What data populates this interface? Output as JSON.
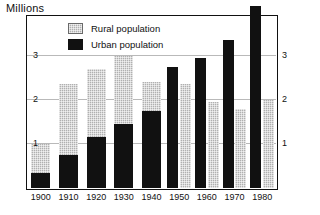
{
  "chart": {
    "title": "Millions",
    "axis_title_position": "top-left"
  },
  "legend": {
    "position": "top-left-inside",
    "items": [
      {
        "key": "rural",
        "label": "Rural population",
        "color": "#b0b0b0",
        "swatch": "rural-swatch"
      },
      {
        "key": "urban",
        "label": "Urban population",
        "color": "#111111",
        "swatch": "urban-swatch"
      }
    ]
  },
  "axes": {
    "y_left_ticks": [
      "3",
      "2",
      "1"
    ],
    "y_right_ticks": [
      "3",
      "2",
      "1"
    ],
    "x_ticks": [
      "1900",
      "1910",
      "1920",
      "1930",
      "1940",
      "1950",
      "1960",
      "1970",
      "1980"
    ]
  },
  "chart_data": {
    "type": "bar",
    "title": "Millions",
    "subtitle": "",
    "xlabel": "",
    "ylabel": "Millions",
    "ylim": [
      0,
      3.9
    ],
    "yticks": [
      1,
      2,
      3
    ],
    "grid": true,
    "legend_position": "top-left",
    "categories": [
      "1900",
      "1910",
      "1920",
      "1930",
      "1940",
      "1950",
      "1960",
      "1970",
      "1980"
    ],
    "layout_note": "1900-1940 drawn as stacked bars (urban below rural); 1950-1980 drawn as side-by-side paired bars",
    "series": [
      {
        "name": "Urban population",
        "color": "#111111",
        "values": [
          0.35,
          0.75,
          1.15,
          1.45,
          1.75,
          2.75,
          2.95,
          3.35,
          3.9
        ]
      },
      {
        "name": "Rural population",
        "color": "#b0b0b0",
        "values": [
          0.65,
          1.6,
          1.55,
          1.55,
          0.65,
          2.35,
          1.95,
          1.8,
          2.0
        ]
      }
    ],
    "stacked_totals": [
      1.0,
      2.35,
      2.7,
      3.0,
      2.4,
      null,
      null,
      null,
      null
    ],
    "annotations": []
  }
}
